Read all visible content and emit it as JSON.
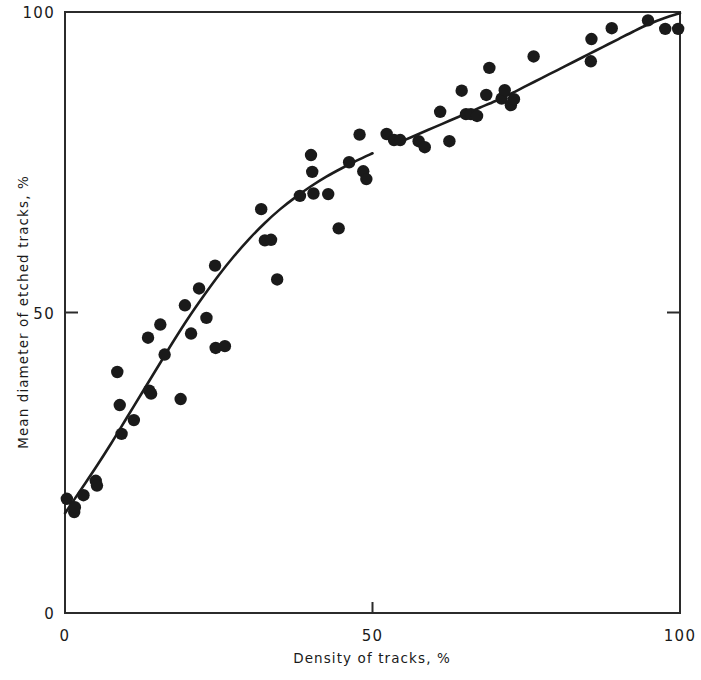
{
  "chart_data": {
    "type": "scatter",
    "title": "",
    "xlabel": "Density of tracks, %",
    "ylabel": "Mean diameter of etched tracks, %",
    "xlim": [
      0,
      100
    ],
    "ylim": [
      0,
      100
    ],
    "xticks": [
      0,
      50,
      100
    ],
    "yticks": [
      0,
      50,
      100
    ],
    "xticklabels": [
      "0",
      "50",
      "100"
    ],
    "yticklabels": [
      "0",
      "50",
      "100"
    ],
    "grid": false,
    "legend": null,
    "points": [
      [
        0.3,
        19.0
      ],
      [
        1.5,
        16.8
      ],
      [
        1.6,
        17.6
      ],
      [
        3.0,
        19.6
      ],
      [
        5.0,
        22.0
      ],
      [
        5.2,
        21.2
      ],
      [
        8.5,
        40.1
      ],
      [
        8.9,
        34.6
      ],
      [
        9.2,
        29.8
      ],
      [
        11.2,
        32.1
      ],
      [
        13.5,
        45.8
      ],
      [
        13.7,
        37.0
      ],
      [
        14.0,
        36.5
      ],
      [
        15.5,
        48.0
      ],
      [
        16.2,
        43.0
      ],
      [
        18.8,
        35.6
      ],
      [
        19.5,
        51.2
      ],
      [
        20.5,
        46.5
      ],
      [
        21.8,
        54.0
      ],
      [
        23.0,
        49.1
      ],
      [
        24.4,
        57.8
      ],
      [
        24.5,
        44.1
      ],
      [
        26.0,
        44.4
      ],
      [
        31.9,
        67.2
      ],
      [
        32.5,
        62.0
      ],
      [
        33.5,
        62.1
      ],
      [
        34.5,
        55.5
      ],
      [
        38.2,
        69.4
      ],
      [
        40.0,
        76.2
      ],
      [
        40.2,
        73.4
      ],
      [
        40.4,
        69.8
      ],
      [
        42.8,
        69.7
      ],
      [
        44.5,
        64.0
      ],
      [
        46.2,
        75.0
      ],
      [
        47.9,
        79.6
      ],
      [
        48.5,
        73.5
      ],
      [
        49.0,
        72.2
      ],
      [
        52.3,
        79.7
      ],
      [
        53.5,
        78.7
      ],
      [
        54.5,
        78.7
      ],
      [
        57.5,
        78.5
      ],
      [
        58.5,
        77.5
      ],
      [
        61.0,
        83.4
      ],
      [
        62.5,
        78.5
      ],
      [
        64.5,
        86.9
      ],
      [
        65.2,
        83.0
      ],
      [
        66.0,
        83.0
      ],
      [
        67.0,
        82.7
      ],
      [
        68.5,
        86.2
      ],
      [
        69.0,
        90.7
      ],
      [
        71.0,
        85.6
      ],
      [
        71.5,
        87.0
      ],
      [
        72.5,
        84.5
      ],
      [
        73.0,
        85.5
      ],
      [
        76.2,
        92.6
      ],
      [
        85.5,
        91.8
      ],
      [
        85.6,
        95.5
      ],
      [
        88.9,
        97.3
      ],
      [
        94.8,
        98.6
      ],
      [
        97.6,
        97.2
      ],
      [
        99.7,
        97.2
      ]
    ],
    "fit_curve": {
      "description": "monotonic saturating fit through the scatter",
      "points": [
        [
          0.0,
          16.6
        ],
        [
          2.5,
          20.4
        ],
        [
          5.0,
          24.2
        ],
        [
          7.5,
          28.2
        ],
        [
          10.0,
          32.4
        ],
        [
          12.5,
          36.6
        ],
        [
          15.0,
          40.8
        ],
        [
          17.5,
          45.0
        ],
        [
          20.0,
          49.0
        ],
        [
          22.5,
          52.7
        ],
        [
          25.0,
          56.2
        ],
        [
          27.5,
          59.4
        ],
        [
          30.0,
          62.3
        ],
        [
          32.5,
          64.9
        ],
        [
          35.0,
          67.2
        ],
        [
          37.5,
          69.2
        ],
        [
          40.0,
          71.0
        ],
        [
          42.5,
          72.6
        ],
        [
          45.0,
          74.0
        ],
        [
          47.5,
          75.3
        ],
        [
          50.0,
          76.5
        ],
        [
          52.5,
          77.6
        ],
        [
          55.0,
          78.6
        ],
        [
          57.5,
          79.7
        ],
        [
          60.0,
          80.8
        ],
        [
          62.5,
          81.9
        ],
        [
          65.0,
          83.0
        ],
        [
          67.5,
          84.1
        ],
        [
          70.0,
          85.2
        ],
        [
          72.5,
          86.4
        ],
        [
          75.0,
          87.7
        ],
        [
          77.5,
          89.0
        ],
        [
          80.0,
          90.3
        ],
        [
          82.5,
          91.6
        ],
        [
          85.0,
          92.9
        ],
        [
          87.5,
          94.2
        ],
        [
          90.0,
          95.5
        ],
        [
          92.5,
          96.8
        ],
        [
          95.0,
          98.0
        ],
        [
          97.5,
          99.0
        ],
        [
          100.0,
          99.8
        ]
      ],
      "gap": [
        51.5,
        54.5
      ]
    }
  }
}
